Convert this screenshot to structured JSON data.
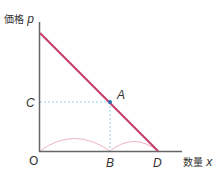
{
  "diagram": {
    "y_axis_label": "価格",
    "y_axis_var": "p",
    "x_axis_label": "数量",
    "x_axis_var": "x",
    "points": {
      "origin": "O",
      "A": "A",
      "B": "B",
      "C": "C",
      "D": "D"
    },
    "colors": {
      "axis": "#666666",
      "demand_line": "#c4406a",
      "dashed_guides": "#8cc8e0",
      "arcs": "#e8a0b0",
      "point_A": "#2a6fb0"
    }
  }
}
